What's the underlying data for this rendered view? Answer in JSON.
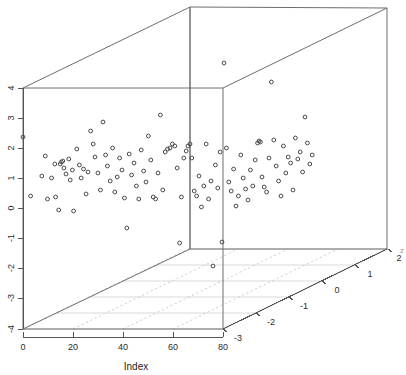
{
  "chart_data": {
    "type": "scatter",
    "projection": "3d",
    "title": "",
    "xlabel": "Index",
    "ylabel": "",
    "zlabel": "",
    "xticks": [
      0,
      20,
      40,
      60,
      80
    ],
    "yticks": [
      -4,
      -3,
      -2,
      -1,
      0,
      1,
      2,
      3,
      4
    ],
    "zticks": [
      -3,
      -2,
      -1,
      0,
      1,
      2
    ],
    "xlim": [
      0,
      80
    ],
    "ylim": [
      -4,
      4
    ],
    "zlim": [
      -3,
      2
    ],
    "grid": "floor-only",
    "legend": null,
    "marker": "open-circle",
    "marker_color": "#4a4a4a",
    "box_color": "#6e6e6e",
    "axis_color": "#555555",
    "grid_color": "#cfcfcf",
    "edge_clipped_label": "z",
    "points_px": [
      [
        23.0,
        137.0
      ],
      [
        30.6,
        196.0
      ],
      [
        41.8,
        176.0
      ],
      [
        45.3,
        156.0
      ],
      [
        47.5,
        199.0
      ],
      [
        51.6,
        178.0
      ],
      [
        54.8,
        164.0
      ],
      [
        55.6,
        197.0
      ],
      [
        58.7,
        210.0
      ],
      [
        60.2,
        164.0
      ],
      [
        61.4,
        162.0
      ],
      [
        62.8,
        161.0
      ],
      [
        63.9,
        168.0
      ],
      [
        66.0,
        174.0
      ],
      [
        68.8,
        159.0
      ],
      [
        70.2,
        180.0
      ],
      [
        72.4,
        170.0
      ],
      [
        73.6,
        211.0
      ],
      [
        76.8,
        149.0
      ],
      [
        79.4,
        165.0
      ],
      [
        81.2,
        178.0
      ],
      [
        83.5,
        169.0
      ],
      [
        86.1,
        194.0
      ],
      [
        88.0,
        172.0
      ],
      [
        90.6,
        131.0
      ],
      [
        93.2,
        144.0
      ],
      [
        95.0,
        157.0
      ],
      [
        97.9,
        173.0
      ],
      [
        100.4,
        190.0
      ],
      [
        103.0,
        122.0
      ],
      [
        105.6,
        155.0
      ],
      [
        107.4,
        166.0
      ],
      [
        110.2,
        181.0
      ],
      [
        112.6,
        148.0
      ],
      [
        114.8,
        192.0
      ],
      [
        117.2,
        177.0
      ],
      [
        119.6,
        158.0
      ],
      [
        122.0,
        170.0
      ],
      [
        124.4,
        198.0
      ],
      [
        126.8,
        228.0
      ],
      [
        129.2,
        154.0
      ],
      [
        131.6,
        175.0
      ],
      [
        134.0,
        163.0
      ],
      [
        136.4,
        186.0
      ],
      [
        138.8,
        199.0
      ],
      [
        141.2,
        150.0
      ],
      [
        143.6,
        171.0
      ],
      [
        146.0,
        182.0
      ],
      [
        148.4,
        136.0
      ],
      [
        150.8,
        160.0
      ],
      [
        153.2,
        197.0
      ],
      [
        155.6,
        199.0
      ],
      [
        158.0,
        173.0
      ],
      [
        160.4,
        115.0
      ],
      [
        162.8,
        190.0
      ],
      [
        165.2,
        152.0
      ],
      [
        167.6,
        149.0
      ],
      [
        170.0,
        148.0
      ],
      [
        172.4,
        144.0
      ],
      [
        174.8,
        146.0
      ],
      [
        177.2,
        168.0
      ],
      [
        179.6,
        243.0
      ],
      [
        181.4,
        197.0
      ],
      [
        183.8,
        158.0
      ],
      [
        186.2,
        151.0
      ],
      [
        188.0,
        146.0
      ],
      [
        190.0,
        144.0
      ],
      [
        191.8,
        158.0
      ],
      [
        194.2,
        191.0
      ],
      [
        196.6,
        196.0
      ],
      [
        199.0,
        176.0
      ],
      [
        201.4,
        207.0
      ],
      [
        203.8,
        186.0
      ],
      [
        206.2,
        144.0
      ],
      [
        208.6,
        199.0
      ],
      [
        211.0,
        181.0
      ],
      [
        213.0,
        266.0
      ],
      [
        215.4,
        165.0
      ],
      [
        217.8,
        188.0
      ],
      [
        220.2,
        152.0
      ],
      [
        222.0,
        242.0
      ],
      [
        224.0,
        63.0
      ],
      [
        226.4,
        148.0
      ],
      [
        228.8,
        182.0
      ],
      [
        231.2,
        191.0
      ],
      [
        233.6,
        169.0
      ],
      [
        236.0,
        206.0
      ],
      [
        238.4,
        196.0
      ],
      [
        240.8,
        155.0
      ],
      [
        243.2,
        178.0
      ],
      [
        245.6,
        189.0
      ],
      [
        248.0,
        200.0
      ],
      [
        250.4,
        170.0
      ],
      [
        252.8,
        186.0
      ],
      [
        255.2,
        160.0
      ],
      [
        257.6,
        143.0
      ],
      [
        259.0,
        141.0
      ],
      [
        260.4,
        142.0
      ],
      [
        262.0,
        177.0
      ],
      [
        264.2,
        187.0
      ],
      [
        266.6,
        192.0
      ],
      [
        269.0,
        158.0
      ],
      [
        271.4,
        82.0
      ],
      [
        273.8,
        140.0
      ],
      [
        276.2,
        166.0
      ],
      [
        278.6,
        181.0
      ],
      [
        281.0,
        196.0
      ],
      [
        283.4,
        146.0
      ],
      [
        285.8,
        173.0
      ],
      [
        288.2,
        157.0
      ],
      [
        290.6,
        163.0
      ],
      [
        293.0,
        190.0
      ],
      [
        295.4,
        138.0
      ],
      [
        297.8,
        159.0
      ],
      [
        300.2,
        152.0
      ],
      [
        302.6,
        172.0
      ],
      [
        305.0,
        117.0
      ],
      [
        307.4,
        143.0
      ],
      [
        309.8,
        164.0
      ],
      [
        312.2,
        155.0
      ]
    ]
  },
  "axes": {
    "x_label": "Index",
    "x_tick_labels": [
      "0",
      "20",
      "40",
      "60",
      "80"
    ],
    "y_tick_labels": [
      "4",
      "3",
      "2",
      "1",
      "0",
      "-1",
      "-2",
      "-3",
      "-4"
    ],
    "z_tick_labels": [
      "-3",
      "-2",
      "-1",
      "0",
      "1",
      "2"
    ],
    "clipped_right_label": "z"
  }
}
